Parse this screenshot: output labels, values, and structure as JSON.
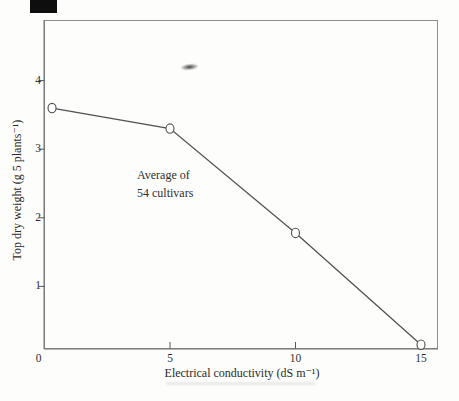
{
  "artifacts": {
    "corner_block_color": "#0e0e0e",
    "smudge_color": "#3a3a3a"
  },
  "chart_data": {
    "type": "line",
    "x": [
      0.3,
      5,
      10,
      15
    ],
    "y": [
      3.6,
      3.3,
      1.78,
      0.15
    ],
    "marker": "open-circle",
    "line_color": "#525252",
    "marker_stroke": "#4f4f4f",
    "frame_color": "#8f8f8f",
    "axis_color": "#6f6f6f",
    "tick_color": "#555555",
    "title": "",
    "xlabel": "Electrical conductivity (dS m⁻¹)",
    "ylabel": "Top dry weight (g 5 plants⁻¹)",
    "xlim": [
      0,
      15.7
    ],
    "ylim": [
      0,
      4.9
    ],
    "grid": false,
    "legend": "none",
    "x_ticks": [
      {
        "v": 0,
        "label": "0"
      },
      {
        "v": 5,
        "label": "5"
      },
      {
        "v": 10,
        "label": "10"
      },
      {
        "v": 15,
        "label": "15"
      }
    ],
    "y_ticks": [
      {
        "v": 1,
        "label": "1"
      },
      {
        "v": 2,
        "label": "2"
      },
      {
        "v": 3,
        "label": "3"
      },
      {
        "v": 4,
        "label": "4"
      }
    ],
    "annotation": {
      "line1": "Average of",
      "line2": "54 cultivars"
    }
  }
}
